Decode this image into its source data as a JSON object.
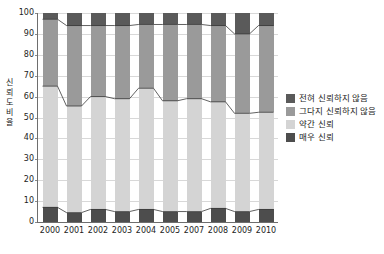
{
  "chart_data": {
    "type": "bar",
    "title": "",
    "subtitle": "",
    "xlabel": "",
    "ylabel": "신뢰도 비율",
    "ylim": [
      0,
      100
    ],
    "yticks": [
      0,
      10,
      20,
      30,
      40,
      50,
      60,
      70,
      80,
      90,
      100
    ],
    "grid": true,
    "stacked": true,
    "stack_total": 100,
    "legend_position": "right",
    "categories": [
      "2000",
      "2001",
      "2002",
      "2003",
      "2004",
      "2005",
      "2007",
      "2008",
      "2009",
      "2010"
    ],
    "series": [
      {
        "name": "매우 신뢰",
        "color": "#4d4d4d",
        "values": [
          7,
          4.5,
          6,
          5,
          6,
          5,
          5,
          6.5,
          5,
          6
        ]
      },
      {
        "name": "약간 신뢰",
        "color": "#d4d4d4",
        "values": [
          58,
          51,
          54,
          54,
          58,
          53,
          54,
          51,
          47,
          46.5
        ]
      },
      {
        "name": "그다지 신뢰하지 않음",
        "color": "#9a9a9a",
        "values": [
          32,
          38.5,
          34,
          35,
          30.5,
          36.5,
          35.5,
          36.5,
          38,
          41.5
        ]
      },
      {
        "name": "전혀 신뢰하지 않음",
        "color": "#5a5a5a",
        "values": [
          3,
          6,
          6,
          6,
          5.5,
          5.5,
          5.5,
          6,
          10,
          6
        ]
      }
    ],
    "cumulative_upper_bounds": {
      "note": "running totals from bottom of stack",
      "bottom_dark": [
        7,
        4.5,
        6,
        5,
        6,
        5,
        5,
        6.5,
        5,
        6
      ],
      "light_gray": [
        65,
        55.5,
        60,
        59,
        64,
        58,
        59,
        57.5,
        52,
        52.5
      ],
      "medium_gray": [
        97,
        94,
        94,
        94,
        94.5,
        94.5,
        94.5,
        94,
        90,
        94
      ],
      "top_dark": [
        100,
        100,
        100,
        100,
        100,
        100,
        100,
        100,
        100,
        100
      ]
    }
  },
  "legend": {
    "items": [
      {
        "label": "전혀 신뢰하지 않음",
        "color": "#5a5a5a"
      },
      {
        "label": "그다지 신뢰하지 않음",
        "color": "#9a9a9a"
      },
      {
        "label": "약간 신뢰",
        "color": "#d4d4d4"
      },
      {
        "label": "매우 신뢰",
        "color": "#4d4d4d"
      }
    ]
  },
  "axes": {
    "y_title": "신뢰도 비율",
    "y_tick_labels": [
      "100",
      "90",
      "80",
      "70",
      "60",
      "50",
      "40",
      "30",
      "20",
      "10",
      "0"
    ],
    "x_tick_labels": [
      "2000",
      "2001",
      "2002",
      "2003",
      "2004",
      "2005",
      "2007",
      "2008",
      "2009",
      "2010"
    ]
  },
  "colors": {
    "grid": "#d8d8d8",
    "axis": "#6e6e6e",
    "text": "#1c1c1c",
    "background": "#ffffff",
    "connector_line": "#3a3a3a"
  }
}
